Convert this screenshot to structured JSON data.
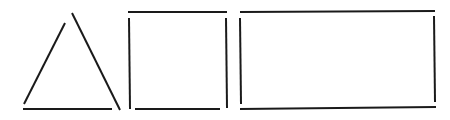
{
  "canvas": {
    "width": 450,
    "height": 120,
    "background": "#ffffff",
    "stroke": "#1a1a1a"
  },
  "shapes": [
    {
      "name": "triangle",
      "segments": [
        {
          "id": "left-edge",
          "x1": 24,
          "y1": 104,
          "x2": 65,
          "y2": 23
        },
        {
          "id": "right-edge",
          "x1": 72,
          "y1": 13,
          "x2": 120,
          "y2": 110
        },
        {
          "id": "base",
          "x1": 23,
          "y1": 109,
          "x2": 112,
          "y2": 109
        }
      ]
    },
    {
      "name": "square",
      "segments": [
        {
          "id": "top",
          "x1": 128,
          "y1": 12,
          "x2": 227,
          "y2": 12
        },
        {
          "id": "left",
          "x1": 129,
          "y1": 18,
          "x2": 130,
          "y2": 109
        },
        {
          "id": "right",
          "x1": 226,
          "y1": 18,
          "x2": 227,
          "y2": 108
        },
        {
          "id": "bottom",
          "x1": 135,
          "y1": 109,
          "x2": 220,
          "y2": 109
        }
      ]
    },
    {
      "name": "rectangle",
      "segments": [
        {
          "id": "top",
          "x1": 240,
          "y1": 12,
          "x2": 435,
          "y2": 11
        },
        {
          "id": "left",
          "x1": 240,
          "y1": 18,
          "x2": 241,
          "y2": 104
        },
        {
          "id": "right",
          "x1": 434,
          "y1": 16,
          "x2": 435,
          "y2": 102
        },
        {
          "id": "bottom",
          "x1": 240,
          "y1": 109,
          "x2": 436,
          "y2": 107
        }
      ]
    }
  ]
}
